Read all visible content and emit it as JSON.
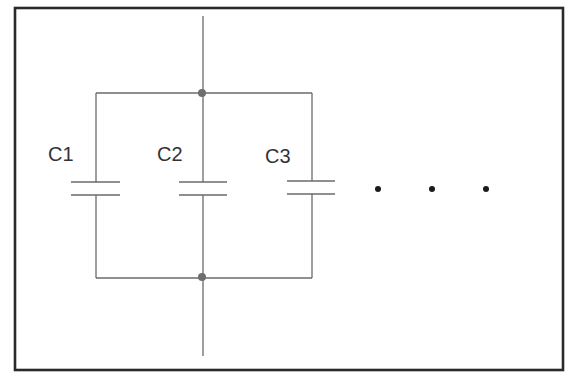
{
  "diagram": {
    "type": "circuit-schematic",
    "capacitors": [
      {
        "label": "C1"
      },
      {
        "label": "C2"
      },
      {
        "label": "C3"
      }
    ],
    "continuation": {
      "symbol": "ellipsis",
      "count": 3
    },
    "junctions": [
      {
        "name": "top-node"
      },
      {
        "name": "bottom-node"
      }
    ],
    "colors": {
      "wire": "#6a6a6a",
      "frame": "#2a2a2a",
      "junction": "#6e6e6e",
      "dots": "#1a1a1a",
      "text": "#333333",
      "background": "#ffffff"
    }
  }
}
